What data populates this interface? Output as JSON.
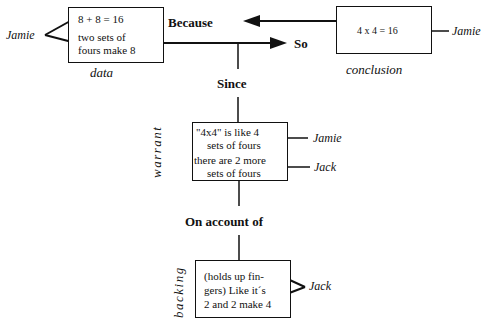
{
  "diagram": {
    "type": "Toulmin argument structure",
    "data": {
      "label": "data",
      "lines": [
        "8 + 8 = 16",
        "two sets of",
        "fours make 8"
      ],
      "speaker": "Jamie"
    },
    "conclusion": {
      "label": "conclusion",
      "text": "4 x 4 = 16",
      "speaker": "Jamie"
    },
    "connectors": {
      "because": "Because",
      "so": "So",
      "since": "Since",
      "on_account_of": "On account of"
    },
    "warrant": {
      "label": "warrant",
      "lines": [
        "\"4x4\" is like 4",
        "sets of fours",
        "there are 2 more",
        "sets of fours"
      ],
      "speakers": [
        "Jamie",
        "Jack"
      ]
    },
    "backing": {
      "label": "backing",
      "lines": [
        "(holds up fin-",
        "gers) Like it´s",
        "2 and 2 make 4"
      ],
      "speaker": "Jack"
    }
  }
}
